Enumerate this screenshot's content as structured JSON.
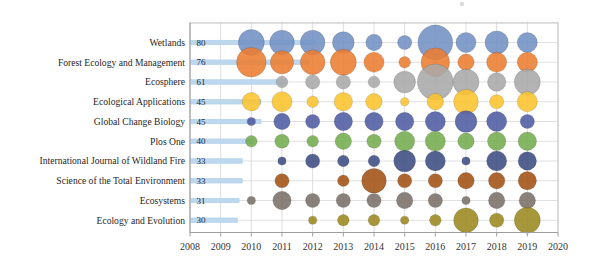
{
  "chart_data": {
    "type": "bubble",
    "title": "",
    "subtitle": "",
    "legend": "none",
    "grid": true,
    "x_axis": {
      "label": "",
      "ticks": [
        "2008",
        "2009",
        "2010",
        "2011",
        "2012",
        "2013",
        "2014",
        "2015",
        "2016",
        "2017",
        "2018",
        "2019",
        "2020"
      ],
      "range": [
        2008,
        2020
      ]
    },
    "y_axis": {
      "label": "",
      "categories": [
        "Wetlands",
        "Forest Ecology and Management",
        "Ecosphere",
        "Ecological Applications",
        "Global Change Biology",
        "Plos One",
        "International Journal of Wildland Fire",
        "Science of the Total Environment",
        "Ecosystems",
        "Ecology and Evolution"
      ]
    },
    "total_bar": {
      "color": "#BDD7EE",
      "border": "#A9CCE8",
      "description": "horizontal bar per journal proportional to total publications"
    },
    "series": [
      {
        "journal": "Wetlands",
        "total": 80,
        "color": "#7291C4",
        "yearly": {
          "2010": 10,
          "2011": 9,
          "2012": 9,
          "2013": 7,
          "2014": 4,
          "2015": 3,
          "2016": 18,
          "2017": 6,
          "2018": 8,
          "2019": 6
        }
      },
      {
        "journal": "Forest Ecology and Management",
        "total": 76,
        "color": "#EC7D31",
        "yearly": {
          "2010": 13,
          "2011": 8,
          "2012": 9,
          "2013": 10,
          "2014": 6,
          "2015": 2,
          "2016": 12,
          "2017": 4,
          "2018": 6,
          "2019": 6
        }
      },
      {
        "journal": "Ecosphere",
        "total": 61,
        "color": "#A8A8A8",
        "yearly": {
          "2011": 2,
          "2012": 3,
          "2013": 3,
          "2014": 2,
          "2015": 7,
          "2016": 19,
          "2017": 10,
          "2018": 5,
          "2019": 10
        }
      },
      {
        "journal": "Ecological Applications",
        "total": 45,
        "color": "#FAC42F",
        "yearly": {
          "2010": 5,
          "2011": 6,
          "2012": 2,
          "2013": 5,
          "2014": 4,
          "2015": 1,
          "2016": 4,
          "2017": 9,
          "2018": 3,
          "2019": 6
        }
      },
      {
        "journal": "Global Change Biology",
        "total": 45,
        "color": "#4F5BA3",
        "yearly": {
          "2010": 1,
          "2011": 4,
          "2012": 3,
          "2013": 5,
          "2014": 5,
          "2015": 5,
          "2016": 6,
          "2017": 7,
          "2018": 6,
          "2019": 3
        }
      },
      {
        "journal": "Plos One",
        "total": 40,
        "color": "#74AC4E",
        "yearly": {
          "2010": 2,
          "2011": 3,
          "2012": 2,
          "2013": 4,
          "2014": 3,
          "2015": 6,
          "2016": 6,
          "2017": 4,
          "2018": 5,
          "2019": 5
        }
      },
      {
        "journal": "International Journal of Wildland Fire",
        "total": 33,
        "color": "#3C4C82",
        "yearly": {
          "2011": 1,
          "2012": 3,
          "2013": 2,
          "2014": 2,
          "2015": 7,
          "2016": 6,
          "2017": 1,
          "2018": 6,
          "2019": 5
        }
      },
      {
        "journal": "Science of the Total Environment",
        "total": 33,
        "color": "#A35114",
        "yearly": {
          "2011": 3,
          "2013": 2,
          "2014": 9,
          "2015": 3,
          "2016": 3,
          "2017": 4,
          "2018": 4,
          "2019": 5
        }
      },
      {
        "journal": "Ecosystems",
        "total": 31,
        "color": "#7A7168",
        "yearly": {
          "2010": 1,
          "2011": 5,
          "2012": 3,
          "2013": 3,
          "2014": 3,
          "2015": 4,
          "2016": 3,
          "2017": 1,
          "2018": 4,
          "2019": 4
        }
      },
      {
        "journal": "Ecology and Evolution",
        "total": 30,
        "color": "#9C881F",
        "yearly": {
          "2012": 1,
          "2013": 2,
          "2014": 2,
          "2015": 1,
          "2016": 2,
          "2017": 9,
          "2018": 3,
          "2019": 10
        }
      }
    ],
    "style": {
      "gridline_color": "#D9D9D9",
      "frame_color": "#C9C9C9",
      "axis_color": "#9E9E9E",
      "bubble_opacity": 0.88
    }
  }
}
